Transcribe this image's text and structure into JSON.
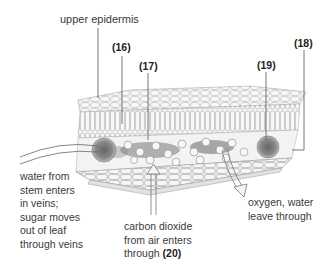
{
  "diagram": {
    "type": "leaf cross-section illustration",
    "labels": {
      "upper_epidermis": "upper epidermis",
      "l16": "(16)",
      "l17": "(17)",
      "l18": "(18)",
      "l19": "(19)",
      "water_lines": [
        "water from",
        "stem enters",
        "in veins;",
        "sugar moves",
        "out of leaf",
        "through veins"
      ],
      "co2_lines": [
        "carbon dioxide",
        "from air enters"
      ],
      "co2_through": "through",
      "l20": "(20)",
      "oxygen_lines": [
        "oxygen, water",
        "leave through"
      ]
    },
    "colors": {
      "line": "#555555",
      "cell_fill": "#eeeeee",
      "cell_stroke": "#9a9a9a",
      "dark_shade": "#4a4a4a"
    }
  }
}
